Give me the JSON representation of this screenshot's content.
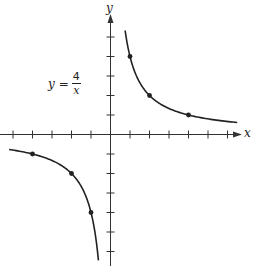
{
  "chart_data": {
    "type": "line",
    "title": "",
    "function": "y = 4/x",
    "annotation": {
      "lhs": "y",
      "equals": "=",
      "numerator": "4",
      "denominator": "x"
    },
    "xlabel": "x",
    "ylabel": "y",
    "xlim": [
      -5.6,
      6.8
    ],
    "ylim": [
      -6.8,
      6.0
    ],
    "x_ticks": [
      -5,
      -4,
      -3,
      -2,
      -1,
      1,
      2,
      3,
      4,
      5,
      6
    ],
    "y_ticks": [
      -6,
      -5,
      -4,
      -3,
      -2,
      -1,
      1,
      2,
      3,
      4,
      5
    ],
    "tick_labels_shown": false,
    "grid": false,
    "legend": null,
    "series": [
      {
        "name": "branch-positive",
        "x_range": [
          0.75,
          6.5
        ],
        "marked_points": [
          [
            1,
            4
          ],
          [
            2,
            2
          ],
          [
            4,
            1
          ]
        ]
      },
      {
        "name": "branch-negative",
        "x_range": [
          -5.2,
          -0.62
        ],
        "marked_points": [
          [
            -4,
            -1
          ],
          [
            -2,
            -2
          ],
          [
            -1,
            -4
          ]
        ]
      }
    ],
    "colors": {
      "curve": "#222222",
      "axis": "#333333"
    }
  },
  "labels": {
    "x_axis": "x",
    "y_axis": "y"
  }
}
